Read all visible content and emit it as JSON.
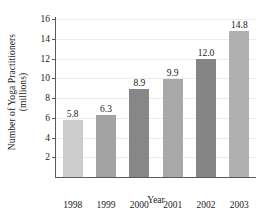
{
  "chart_data": {
    "type": "bar",
    "title": "",
    "xlabel": "Year",
    "ylabel_line1": "Number of Yoga Practitioners",
    "ylabel_line2": "(millions)",
    "categories": [
      "1998",
      "1999",
      "2000",
      "2001",
      "2002",
      "2003"
    ],
    "values": [
      5.8,
      6.3,
      8.9,
      9.9,
      12.0,
      14.8
    ],
    "value_labels": [
      "5.8",
      "6.3",
      "8.9",
      "9.9",
      "12.0",
      "14.8"
    ],
    "bar_colors": [
      "#cdcdcd",
      "#a3a3a3",
      "#878787",
      "#a8a8a8",
      "#858585",
      "#b0b0b0"
    ],
    "ylim": [
      0,
      16
    ],
    "yticks": [
      2,
      4,
      6,
      8,
      10,
      12,
      14,
      16
    ],
    "ytick_labels": [
      "2",
      "4",
      "6",
      "8",
      "10",
      "12",
      "14",
      "16"
    ],
    "grid": true,
    "grid_color": "#eceaea",
    "axis_color": "#5a5a5a",
    "legend": "none",
    "background": "#ffffff"
  }
}
